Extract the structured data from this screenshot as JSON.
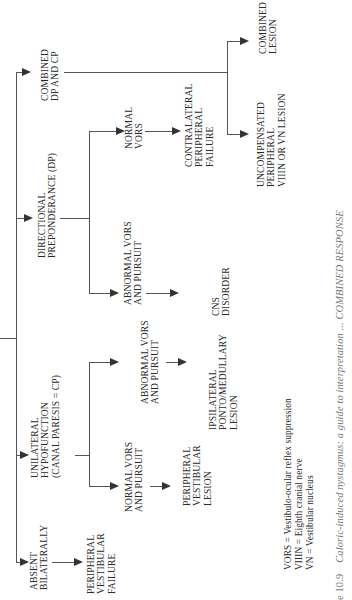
{
  "diagram": {
    "nodes": {
      "absent_bilaterally": [
        "ABSENT",
        "BILATERALLY"
      ],
      "peripheral_vestibular_failure": [
        "PERIPHERAL",
        "VESTIBULAR",
        "FAILURE"
      ],
      "unilateral_hypofunction": [
        "UNILATERAL",
        "HYPOFUNCTION",
        "(CANAL PARESIS = CP)"
      ],
      "normal_vors_pursuit": [
        "NORMAL VORS",
        "AND PURSUIT"
      ],
      "peripheral_vestibular_lesion": [
        "PERIPHERAL",
        "VESTIBULAR",
        "LESION"
      ],
      "abnormal_vors_pursuit_cp": [
        "ABNORMAL VORS",
        "AND PURSUIT"
      ],
      "ipsilateral_lesion": [
        "IPSILATERAL",
        "PONTO/MEDULLARY",
        "LESION"
      ],
      "directional_preponderance": [
        "DIRECTIONAL",
        "PREPONDERANCE (DP)"
      ],
      "abnormal_vors_pursuit_dp": [
        "ABNORMAL VORS",
        "AND PURSUIT"
      ],
      "cns_disorder": [
        "CNS",
        "DISORDER"
      ],
      "normal_vors": [
        "NORMAL",
        "VORS"
      ],
      "contralateral_failure": [
        "CONTRALATERAL",
        "PERIPHERAL",
        "FAILURE"
      ],
      "combined_dp_cp": [
        "COMBINED",
        "DP AND CP"
      ],
      "uncompensated": [
        "UNCOMPENSATED",
        "PERIPHERAL",
        "VIIIN OR VN LESION"
      ],
      "combined_lesion": [
        "COMBINED",
        "LESION"
      ]
    },
    "edges": [
      [
        "root",
        "absent_bilaterally"
      ],
      [
        "root",
        "unilateral_hypofunction"
      ],
      [
        "root",
        "directional_preponderance"
      ],
      [
        "root",
        "combined_dp_cp"
      ],
      [
        "absent_bilaterally",
        "peripheral_vestibular_failure"
      ],
      [
        "unilateral_hypofunction",
        "normal_vors_pursuit"
      ],
      [
        "unilateral_hypofunction",
        "abnormal_vors_pursuit_cp"
      ],
      [
        "normal_vors_pursuit",
        "peripheral_vestibular_lesion"
      ],
      [
        "abnormal_vors_pursuit_cp",
        "ipsilateral_lesion"
      ],
      [
        "directional_preponderance",
        "abnormal_vors_pursuit_dp"
      ],
      [
        "directional_preponderance",
        "normal_vors"
      ],
      [
        "abnormal_vors_pursuit_dp",
        "cns_disorder"
      ],
      [
        "normal_vors",
        "contralateral_failure"
      ],
      [
        "combined_dp_cp",
        "uncompensated"
      ],
      [
        "combined_dp_cp",
        "combined_lesion"
      ]
    ],
    "legend": [
      "VORS = Vestibulo-ocular reflex suppression",
      "VIIIN = Eighth cranial nerve",
      "VN = Vestibular nucleus"
    ],
    "caption": {
      "figure": "e 10.9",
      "text": "Caloric-induced nystagmus: a guide to interpretation ... COMBINED RESPONSE"
    }
  }
}
